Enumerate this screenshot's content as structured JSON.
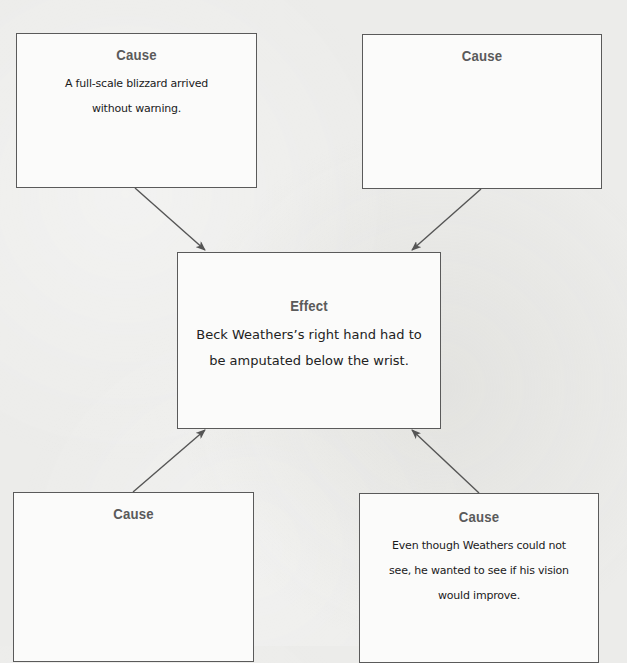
{
  "diagram": {
    "type": "cause-effect organizer",
    "effect": {
      "title": "Effect",
      "text": "Beck Weathers's right hand had to be amputated below the wrist.",
      "lines": [
        "Beck Weathers’s right hand had to",
        "be amputated below the wrist."
      ]
    },
    "causes": [
      {
        "position": "top-left",
        "title": "Cause",
        "lines": [
          "A full-scale blizzard arrived",
          "without warning."
        ]
      },
      {
        "position": "top-right",
        "title": "Cause",
        "lines": []
      },
      {
        "position": "bottom-left",
        "title": "Cause",
        "lines": []
      },
      {
        "position": "bottom-right",
        "title": "Cause",
        "lines": [
          "Even though Weathers could not",
          "see, he wanted to see if his vision",
          "would improve."
        ]
      }
    ],
    "arrows": [
      {
        "from": "top-left",
        "to": "effect"
      },
      {
        "from": "top-right",
        "to": "effect"
      },
      {
        "from": "bottom-left",
        "to": "effect"
      },
      {
        "from": "bottom-right",
        "to": "effect"
      }
    ],
    "colors": {
      "border": "#5a5a5a",
      "title": "#5a5a5a",
      "box_fill": "#fbfbfa",
      "background": "#ececea",
      "arrow": "#555555"
    }
  }
}
